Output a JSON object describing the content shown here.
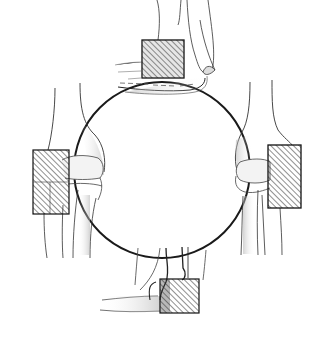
{
  "figure": {
    "description": "Anatomical illustration: four views of the elbow joint arranged around a circle, each with a hatched rectangular region marking an area",
    "colors": {
      "background": "#ffffff",
      "line": "#1a1a1a",
      "shade": "#9a9a9a",
      "hatch": "#333333"
    },
    "circle": {
      "cx": 162,
      "cy": 170,
      "r": 88
    },
    "views": [
      {
        "id": "top",
        "label": "Elbow flexed, lateral view (top)",
        "hatch_box": {
          "x": 142,
          "y": 40,
          "w": 42,
          "h": 38
        }
      },
      {
        "id": "left",
        "label": "Elbow extended, view from left",
        "hatch_box": {
          "x": 33,
          "y": 150,
          "w": 36,
          "h": 64
        }
      },
      {
        "id": "right",
        "label": "Elbow extended, view from right",
        "hatch_box": {
          "x": 268,
          "y": 145,
          "w": 33,
          "h": 63
        }
      },
      {
        "id": "bottom",
        "label": "Elbow flexed, view from below",
        "hatch_box": {
          "x": 160,
          "y": 279,
          "w": 39,
          "h": 34
        }
      }
    ]
  }
}
